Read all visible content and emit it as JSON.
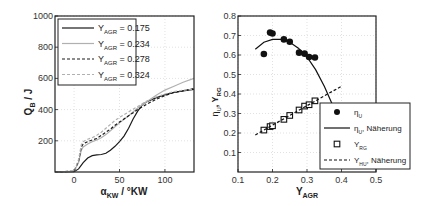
{
  "chart_data": [
    {
      "type": "line",
      "title": "",
      "xlabel": "α_KW / °KW",
      "ylabel": "Q_B / J",
      "xlim": [
        -21,
        132
      ],
      "ylim": [
        0,
        1000
      ],
      "xticks": [
        0,
        50,
        100
      ],
      "yticks": [
        200,
        400,
        600,
        800,
        1000
      ],
      "grid": true,
      "legend_position": "upper left",
      "series": [
        {
          "name": "Y_AGR = 0.175",
          "style": "solid",
          "color": "#1a1a1a",
          "x": [
            -21,
            0,
            5,
            10,
            15,
            20,
            25,
            30,
            35,
            40,
            45,
            50,
            55,
            60,
            65,
            70,
            75,
            80,
            90,
            100,
            110,
            120,
            132
          ],
          "y": [
            0,
            2,
            20,
            60,
            90,
            105,
            110,
            112,
            120,
            140,
            165,
            195,
            230,
            280,
            340,
            390,
            430,
            450,
            475,
            495,
            510,
            520,
            530
          ]
        },
        {
          "name": "Y_AGR = 0.234",
          "style": "solid",
          "color": "#b0b0b0",
          "x": [
            -21,
            0,
            5,
            8,
            10,
            15,
            20,
            25,
            30,
            35,
            40,
            45,
            50,
            60,
            70,
            80,
            90,
            100,
            110,
            120,
            132
          ],
          "y": [
            0,
            5,
            60,
            140,
            160,
            180,
            195,
            205,
            220,
            240,
            265,
            290,
            315,
            360,
            410,
            450,
            490,
            525,
            550,
            575,
            600
          ]
        },
        {
          "name": "Y_AGR = 0.278",
          "style": "dashed",
          "color": "#1a1a1a",
          "x": [
            -21,
            0,
            5,
            8,
            10,
            15,
            20,
            25,
            30,
            35,
            40,
            45,
            50,
            60,
            70,
            80,
            90,
            100,
            110,
            120,
            132
          ],
          "y": [
            0,
            5,
            70,
            160,
            180,
            195,
            205,
            215,
            235,
            255,
            275,
            300,
            320,
            360,
            400,
            435,
            465,
            490,
            510,
            520,
            535
          ]
        },
        {
          "name": "Y_AGR = 0.324",
          "style": "dashed",
          "color": "#b0b0b0",
          "x": [
            -21,
            0,
            5,
            8,
            10,
            15,
            20,
            25,
            30,
            35,
            40,
            45,
            50,
            60,
            70,
            80,
            90,
            100,
            110,
            120,
            132
          ],
          "y": [
            0,
            5,
            80,
            175,
            195,
            210,
            220,
            235,
            255,
            280,
            305,
            330,
            350,
            385,
            420,
            455,
            480,
            500,
            515,
            525,
            530
          ]
        }
      ]
    },
    {
      "type": "scatter",
      "title": "",
      "xlabel": "Y_AGR",
      "ylabel": "η_U, Y_RG",
      "xlim": [
        0.1,
        0.5
      ],
      "ylim": [
        0,
        0.8
      ],
      "xticks": [
        0.1,
        0.2,
        0.3,
        0.4,
        0.5
      ],
      "yticks": [
        0.1,
        0.2,
        0.3,
        0.4,
        0.5,
        0.6,
        0.7,
        0.8
      ],
      "grid": true,
      "legend_position": "lower right",
      "series": [
        {
          "name": "η_U",
          "marker": "filled-circle",
          "x": [
            0.175,
            0.193,
            0.2,
            0.233,
            0.25,
            0.277,
            0.293,
            0.306,
            0.323
          ],
          "y": [
            0.605,
            0.715,
            0.71,
            0.68,
            0.668,
            0.612,
            0.607,
            0.59,
            0.587
          ]
        },
        {
          "name": "η_U, Näherung",
          "style": "solid",
          "x": [
            0.15,
            0.175,
            0.2,
            0.225,
            0.25,
            0.275,
            0.3,
            0.325,
            0.35,
            0.375,
            0.4
          ],
          "y": [
            0.63,
            0.665,
            0.68,
            0.68,
            0.665,
            0.635,
            0.59,
            0.525,
            0.44,
            0.34,
            0.22
          ]
        },
        {
          "name": "Y_RG",
          "marker": "open-square",
          "x": [
            0.175,
            0.193,
            0.2,
            0.233,
            0.25,
            0.277,
            0.293,
            0.306,
            0.323
          ],
          "y": [
            0.215,
            0.233,
            0.237,
            0.27,
            0.29,
            0.318,
            0.338,
            0.345,
            0.365
          ]
        },
        {
          "name": "Y_HU, Näherung",
          "style": "dashed",
          "x": [
            0.15,
            0.4
          ],
          "y": [
            0.19,
            0.44
          ]
        }
      ]
    }
  ],
  "left_plot": {
    "ylabel_main": "Q",
    "ylabel_sub": "B",
    "ylabel_unit": " / J",
    "xlabel_main": "α",
    "xlabel_sub": "KW",
    "xlabel_unit": " / °KW",
    "legend": [
      {
        "main": "Y",
        "sub": "AGR",
        "rest": " = 0.175"
      },
      {
        "main": "Y",
        "sub": "AGR",
        "rest": " = 0.234"
      },
      {
        "main": "Y",
        "sub": "AGR",
        "rest": " = 0.278"
      },
      {
        "main": "Y",
        "sub": "AGR",
        "rest": " = 0.324"
      }
    ]
  },
  "right_plot": {
    "ylabel_a": "η",
    "ylabel_a_sub": "U",
    "ylabel_sep": ", ",
    "ylabel_b": "Y",
    "ylabel_b_sub": "RG",
    "xlabel_main": "Y",
    "xlabel_sub": "AGR",
    "legend": [
      {
        "main": "η",
        "sub": "U",
        "rest": ""
      },
      {
        "main": "η",
        "sub": "U",
        "rest": ", Näherung"
      },
      {
        "main": "Y",
        "sub": "RG",
        "rest": ""
      },
      {
        "main": "Y",
        "sub": "HU",
        "rest": ", Näherung"
      }
    ]
  }
}
